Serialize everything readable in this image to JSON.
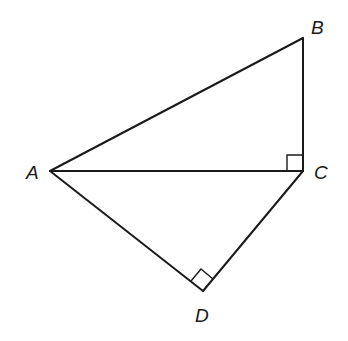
{
  "diagram": {
    "type": "geometry",
    "points": {
      "A": {
        "label": "A",
        "x": 50,
        "y": 171
      },
      "B": {
        "label": "B",
        "x": 303,
        "y": 38
      },
      "C": {
        "label": "C",
        "x": 303,
        "y": 171
      },
      "D": {
        "label": "D",
        "x": 203,
        "y": 291
      }
    },
    "segments": [
      "AB",
      "BC",
      "AC",
      "AD",
      "CD"
    ],
    "right_angles": [
      "ACB",
      "ADC"
    ]
  }
}
